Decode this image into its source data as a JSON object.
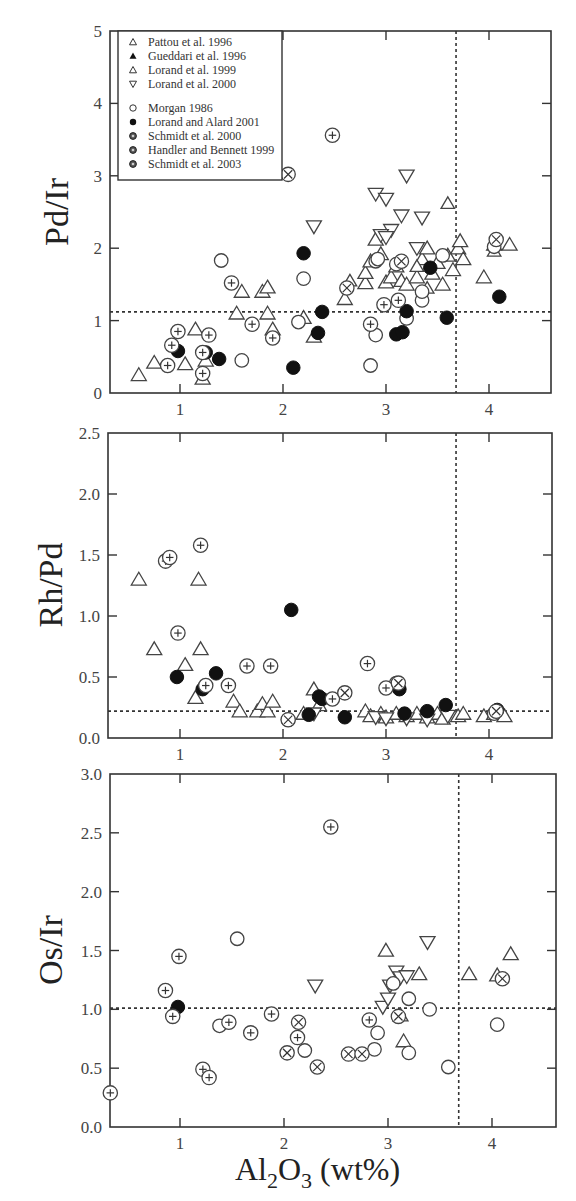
{
  "figure": {
    "xlabel": {
      "main": "Al",
      "sub1": "2",
      "mid": "O",
      "sub2": "3",
      "tail": " (wt%)"
    }
  },
  "legend": {
    "entries": [
      {
        "label": "Pattou et al. 1996",
        "marker": "triangle-open-small"
      },
      {
        "label": "Gueddari et al. 1996",
        "marker": "triangle-filled"
      },
      {
        "label": "Lorand et al. 1999",
        "marker": "triangle-open"
      },
      {
        "label": "Lorand et al. 2000",
        "marker": "triangle-down-open"
      },
      {
        "label": "Morgan 1986",
        "marker": "circle-open"
      },
      {
        "label": "Lorand and Alard 2001",
        "marker": "circle-filled"
      },
      {
        "label": "Schmidt et al. 2000",
        "marker": "circle-dot"
      },
      {
        "label": "Handler and Bennett 1999",
        "marker": "circle-plus"
      },
      {
        "label": "Schmidt et al. 2003",
        "marker": "circle-cross"
      }
    ]
  },
  "chart_data": [
    {
      "type": "scatter",
      "title": "",
      "xlabel": "Al2O3 (wt%)",
      "ylabel": "Pd/Ir",
      "xlim": [
        0.33,
        4.6
      ],
      "ylim": [
        0,
        5
      ],
      "xticks": [
        1,
        2,
        3,
        4
      ],
      "yticks": [
        0,
        1,
        2,
        3,
        4,
        5
      ],
      "ytick_labels": [
        "0",
        "1",
        "2",
        "3",
        "4",
        "5"
      ],
      "grid": false,
      "legend_position": "upper-left inset",
      "reference_lines": {
        "horizontal": 1.12,
        "vertical": 3.68
      },
      "series": [
        {
          "name": "Lorand et al. 1999",
          "marker": "triangle-open",
          "points": [
            [
              0.6,
              0.25
            ],
            [
              0.75,
              0.42
            ],
            [
              1.05,
              0.4
            ],
            [
              1.15,
              0.88
            ],
            [
              1.22,
              0.2
            ],
            [
              1.25,
              0.45
            ],
            [
              1.55,
              1.1
            ],
            [
              1.6,
              1.4
            ],
            [
              1.8,
              1.4
            ],
            [
              1.85,
              1.46
            ],
            [
              1.85,
              1.1
            ],
            [
              1.9,
              0.88
            ],
            [
              2.2,
              1.04
            ],
            [
              2.3,
              0.78
            ],
            [
              2.6,
              1.3
            ],
            [
              2.8,
              1.52
            ],
            [
              2.8,
              1.66
            ],
            [
              2.85,
              1.82
            ],
            [
              2.9,
              2.12
            ],
            [
              2.95,
              1.92
            ],
            [
              3.0,
              1.53
            ],
            [
              3.05,
              1.6
            ],
            [
              3.1,
              1.75
            ],
            [
              3.15,
              1.55
            ],
            [
              3.2,
              1.5
            ],
            [
              3.3,
              1.6
            ],
            [
              3.35,
              1.85
            ],
            [
              3.4,
              2.0
            ],
            [
              3.45,
              1.65
            ],
            [
              3.5,
              1.8
            ],
            [
              3.55,
              1.5
            ],
            [
              3.6,
              1.9
            ],
            [
              3.65,
              1.7
            ],
            [
              3.7,
              2.0
            ],
            [
              3.72,
              2.1
            ],
            [
              3.75,
              1.85
            ],
            [
              3.95,
              1.6
            ],
            [
              4.05,
              2.05
            ],
            [
              4.2,
              2.05
            ]
          ]
        },
        {
          "name": "Pattou et al. 1996",
          "marker": "triangle-open-small",
          "points": [
            [
              3.6,
              2.62
            ],
            [
              3.3,
              1.75
            ],
            [
              4.05,
              1.96
            ],
            [
              2.65,
              1.55
            ],
            [
              3.4,
              1.45
            ]
          ]
        },
        {
          "name": "Lorand et al. 2000",
          "marker": "triangle-down-open",
          "points": [
            [
              2.3,
              2.3
            ],
            [
              2.9,
              2.75
            ],
            [
              3.0,
              2.68
            ],
            [
              3.2,
              3.0
            ],
            [
              3.05,
              2.25
            ],
            [
              3.15,
              2.45
            ],
            [
              3.35,
              2.42
            ],
            [
              2.95,
              2.18
            ],
            [
              3.0,
              2.15
            ],
            [
              3.3,
              2.0
            ]
          ]
        },
        {
          "name": "Morgan 1986",
          "marker": "circle-open",
          "points": [
            [
              1.4,
              1.83
            ],
            [
              1.6,
              0.45
            ],
            [
              2.15,
              0.98
            ],
            [
              2.2,
              1.58
            ],
            [
              2.85,
              0.38
            ],
            [
              2.9,
              0.8
            ],
            [
              2.9,
              1.82
            ],
            [
              3.1,
              1.78
            ],
            [
              3.2,
              1.03
            ],
            [
              3.35,
              1.28
            ],
            [
              3.35,
              1.4
            ],
            [
              3.55,
              1.9
            ],
            [
              4.05,
              2.02
            ],
            [
              2.92,
              1.85
            ]
          ]
        },
        {
          "name": "Lorand and Alard 2001",
          "marker": "circle-filled",
          "points": [
            [
              0.98,
              0.58
            ],
            [
              1.25,
              0.56
            ],
            [
              1.38,
              0.47
            ],
            [
              2.1,
              0.35
            ],
            [
              2.2,
              1.93
            ],
            [
              2.34,
              0.83
            ],
            [
              2.38,
              1.12
            ],
            [
              3.1,
              0.81
            ],
            [
              3.16,
              0.84
            ],
            [
              3.2,
              1.13
            ],
            [
              3.43,
              1.73
            ],
            [
              3.59,
              1.04
            ],
            [
              4.1,
              1.33
            ]
          ]
        },
        {
          "name": "Handler and Bennett 1999",
          "marker": "circle-plus",
          "points": [
            [
              0.88,
              0.38
            ],
            [
              0.92,
              0.66
            ],
            [
              0.98,
              0.85
            ],
            [
              1.22,
              0.27
            ],
            [
              1.22,
              0.56
            ],
            [
              1.28,
              0.8
            ],
            [
              1.5,
              1.52
            ],
            [
              1.7,
              0.95
            ],
            [
              1.9,
              0.76
            ],
            [
              2.48,
              3.56
            ],
            [
              2.85,
              0.95
            ],
            [
              2.98,
              1.22
            ],
            [
              3.12,
              1.28
            ]
          ]
        },
        {
          "name": "Schmidt et al. 2003",
          "marker": "circle-cross",
          "points": [
            [
              2.05,
              3.02
            ],
            [
              2.62,
              1.45
            ],
            [
              3.15,
              1.82
            ],
            [
              4.07,
              2.12
            ]
          ]
        }
      ]
    },
    {
      "type": "scatter",
      "xlabel": "Al2O3 (wt%)",
      "ylabel": "Rh/Pd",
      "xlim": [
        0.33,
        4.6
      ],
      "ylim": [
        0,
        2.5
      ],
      "xticks": [
        1,
        2,
        3,
        4
      ],
      "yticks": [
        0,
        0.5,
        1.0,
        1.5,
        2.0,
        2.5
      ],
      "ytick_labels": [
        "0.0",
        "0.5",
        "1.0",
        "1.5",
        "2.0",
        "2.5"
      ],
      "grid": false,
      "reference_lines": {
        "horizontal": 0.22,
        "vertical": 3.68
      },
      "series": [
        {
          "name": "Lorand et al. 1999",
          "marker": "triangle-open",
          "points": [
            [
              0.6,
              1.3
            ],
            [
              0.75,
              0.73
            ],
            [
              1.05,
              0.6
            ],
            [
              1.15,
              0.33
            ],
            [
              1.18,
              1.3
            ],
            [
              1.2,
              0.73
            ],
            [
              1.52,
              0.3
            ],
            [
              1.58,
              0.22
            ],
            [
              1.75,
              0.22
            ],
            [
              1.8,
              0.28
            ],
            [
              1.85,
              0.22
            ],
            [
              1.9,
              0.3
            ],
            [
              2.2,
              0.2
            ],
            [
              2.3,
              0.4
            ],
            [
              2.35,
              0.27
            ],
            [
              2.8,
              0.22
            ],
            [
              2.85,
              0.18
            ],
            [
              2.95,
              0.2
            ],
            [
              3.0,
              0.17
            ],
            [
              3.1,
              0.2
            ],
            [
              3.2,
              0.18
            ],
            [
              3.3,
              0.2
            ],
            [
              3.4,
              0.17
            ],
            [
              3.5,
              0.2
            ],
            [
              3.55,
              0.16
            ],
            [
              3.7,
              0.18
            ],
            [
              3.75,
              0.2
            ],
            [
              3.95,
              0.18
            ],
            [
              4.05,
              0.2
            ],
            [
              4.15,
              0.18
            ]
          ]
        },
        {
          "name": "Lorand et al. 2000",
          "marker": "triangle-down-open",
          "points": [
            [
              2.3,
              0.2
            ],
            [
              2.9,
              0.17
            ],
            [
              3.0,
              0.16
            ],
            [
              3.2,
              0.16
            ],
            [
              3.4,
              0.15
            ],
            [
              3.6,
              0.18
            ]
          ]
        },
        {
          "name": "Morgan 1986",
          "marker": "circle-open",
          "points": [
            [
              2.05,
              0.15
            ],
            [
              3.1,
              0.45
            ],
            [
              4.05,
              0.2
            ]
          ]
        },
        {
          "name": "Lorand and Alard 2001",
          "marker": "circle-filled",
          "points": [
            [
              0.97,
              0.5
            ],
            [
              1.22,
              0.4
            ],
            [
              1.35,
              0.53
            ],
            [
              2.08,
              1.05
            ],
            [
              2.25,
              0.19
            ],
            [
              2.35,
              0.34
            ],
            [
              2.38,
              0.32
            ],
            [
              2.6,
              0.17
            ],
            [
              3.13,
              0.4
            ],
            [
              3.18,
              0.2
            ],
            [
              3.4,
              0.22
            ],
            [
              3.58,
              0.27
            ],
            [
              4.08,
              0.23
            ]
          ]
        },
        {
          "name": "Handler and Bennett 1999",
          "marker": "circle-plus",
          "points": [
            [
              0.86,
              1.45
            ],
            [
              0.9,
              1.48
            ],
            [
              0.98,
              0.86
            ],
            [
              1.2,
              1.58
            ],
            [
              1.25,
              0.43
            ],
            [
              1.47,
              0.43
            ],
            [
              1.65,
              0.59
            ],
            [
              1.88,
              0.59
            ],
            [
              2.48,
              0.32
            ],
            [
              2.82,
              0.61
            ],
            [
              3.0,
              0.41
            ]
          ]
        },
        {
          "name": "Schmidt et al. 2003",
          "marker": "circle-cross",
          "points": [
            [
              2.05,
              0.15
            ],
            [
              2.6,
              0.37
            ],
            [
              3.12,
              0.45
            ],
            [
              4.07,
              0.22
            ]
          ]
        }
      ]
    },
    {
      "type": "scatter",
      "xlabel": "Al2O3 (wt%)",
      "ylabel": "Os/Ir",
      "xlim": [
        0.33,
        4.6
      ],
      "ylim": [
        0,
        3.0
      ],
      "xticks": [
        1,
        2,
        3,
        4
      ],
      "yticks": [
        0,
        0.5,
        1.0,
        1.5,
        2.0,
        2.5,
        3.0
      ],
      "ytick_labels": [
        "0.0",
        "0.5",
        "1.0",
        "1.5",
        "2.0",
        "2.5",
        "3.0"
      ],
      "grid": false,
      "reference_lines": {
        "horizontal": 1.01,
        "vertical": 3.68
      },
      "series": [
        {
          "name": "Lorand et al. 1999",
          "marker": "triangle-open",
          "points": [
            [
              2.98,
              1.5
            ],
            [
              3.12,
              0.95
            ],
            [
              3.3,
              1.3
            ],
            [
              3.78,
              1.3
            ],
            [
              4.05,
              1.29
            ],
            [
              4.18,
              1.47
            ],
            [
              3.15,
              0.73
            ]
          ]
        },
        {
          "name": "Lorand et al. 2000",
          "marker": "triangle-down-open",
          "points": [
            [
              2.3,
              1.2
            ],
            [
              2.95,
              1.02
            ],
            [
              3.02,
              1.2
            ],
            [
              3.0,
              1.09
            ],
            [
              3.08,
              1.32
            ],
            [
              3.12,
              1.27
            ],
            [
              3.18,
              1.28
            ],
            [
              3.38,
              1.57
            ]
          ]
        },
        {
          "name": "Morgan 1986",
          "marker": "circle-open",
          "points": [
            [
              1.38,
              0.86
            ],
            [
              1.55,
              1.6
            ],
            [
              2.2,
              0.65
            ],
            [
              2.9,
              0.8
            ],
            [
              2.87,
              0.66
            ],
            [
              3.05,
              1.22
            ],
            [
              3.2,
              0.63
            ],
            [
              3.2,
              1.09
            ],
            [
              3.4,
              1.0
            ],
            [
              3.58,
              0.51
            ],
            [
              4.05,
              0.87
            ]
          ]
        },
        {
          "name": "Lorand and Alard 2001",
          "marker": "circle-filled",
          "points": [
            [
              0.98,
              1.02
            ]
          ]
        },
        {
          "name": "Handler and Bennett 1999",
          "marker": "circle-plus",
          "points": [
            [
              0.33,
              0.29
            ],
            [
              0.86,
              1.16
            ],
            [
              0.93,
              0.94
            ],
            [
              0.99,
              1.45
            ],
            [
              1.22,
              0.49
            ],
            [
              1.28,
              0.42
            ],
            [
              1.47,
              0.89
            ],
            [
              1.68,
              0.8
            ],
            [
              1.88,
              0.96
            ],
            [
              2.13,
              0.76
            ],
            [
              2.45,
              2.55
            ],
            [
              2.82,
              0.91
            ]
          ]
        },
        {
          "name": "Schmidt et al. 2003",
          "marker": "circle-cross",
          "points": [
            [
              2.03,
              0.63
            ],
            [
              2.14,
              0.89
            ],
            [
              2.32,
              0.51
            ],
            [
              2.62,
              0.62
            ],
            [
              2.75,
              0.62
            ],
            [
              3.1,
              0.94
            ],
            [
              4.1,
              1.26
            ]
          ]
        }
      ]
    }
  ]
}
